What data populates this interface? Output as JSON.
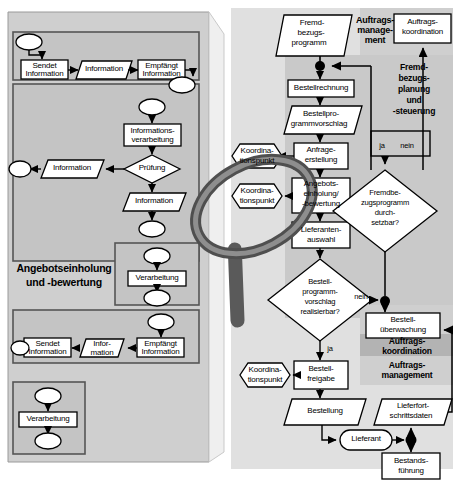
{
  "diagram": {
    "title_left": "Angebotseinholung und -bewertung",
    "left_panel": {
      "group_label_line1": "Angebotseinholung",
      "group_label_line2": "und -bewertung",
      "top_row": {
        "sendet": "Sendet Information",
        "flow": "Information",
        "empfaengt": "Empfängt Information"
      },
      "middle": {
        "verarbeitung": "Informations- verarbeitung",
        "verarbeitung_l1": "Informations-",
        "verarbeitung_l2": "verarbeitung",
        "pruefung": "Prüfung",
        "info_left": "Information",
        "info_down": "Information"
      },
      "verarbeitung_box": "Verarbeitung",
      "bottom_row": {
        "empfaengt": "Empfängt Information",
        "flow_l1": "Infor-",
        "flow_l2": "mation",
        "sendet": "Sendet Information"
      },
      "bottom_box": "Verarbeitung"
    },
    "right_panel": {
      "fremdbezugsprogramm_l1": "Fremd-",
      "fremdbezugsprogramm_l2": "bezugs-",
      "fremdbezugsprogramm_l3": "programm",
      "auftragsmanagement_l1": "Auftrags-",
      "auftragsmanagement_l2": "manage-",
      "auftragsmanagement_l3": "ment",
      "auftragskoordination_l1": "Auftrags-",
      "auftragskoordination_l2": "koordination",
      "bestellrechnung": "Bestellrechnung",
      "bestellprogrammvorschlag_l1": "Bestellpro-",
      "bestellprogrammvorschlag_l2": "grammvorschlag",
      "fremdbezugsplanung_l1": "Fremd-",
      "fremdbezugsplanung_l2": "bezugs-",
      "fremdbezugsplanung_l3": "planung",
      "fremdbezugsplanung_l4": "und",
      "fremdbezugsplanung_l5": "-steuerung",
      "anfrageerstellung_l1": "Anfrage-",
      "anfrageerstellung_l2": "erstellung",
      "koordinationspunkt_top_l1": "Koordina-",
      "koordinationspunkt_top_l2": "tionspunkt",
      "koordinationspunkt_mid_l1": "Koordina-",
      "koordinationspunkt_mid_l2": "tionspunkt",
      "angebotseinholung_l1": "Angebots-",
      "angebotseinholung_l2": "einholung/",
      "angebotseinholung_l3": "-bewertung",
      "lieferantenauswahl_l1": "Lieferanten-",
      "lieferantenauswahl_l2": "auswahl",
      "fremdbezug_decision_l1": "Fremdbe-",
      "fremdbezug_decision_l2": "zugsprogramm",
      "fremdbezug_decision_l3": "durch-",
      "fremdbezug_decision_l4": "setzbar?",
      "bestellprogramm_decision_l1": "Bestell-",
      "bestellprogramm_decision_l2": "programm-",
      "bestellprogramm_decision_l3": "vorschlag",
      "bestellprogramm_decision_l4": "realisierbar?",
      "ja_label": "ja",
      "nein_label": "nein",
      "ja_nein_ja": "ja",
      "ja_nein_nein": "nein",
      "nein_branch": "nein",
      "bestelluberwachung_l1": "Bestell-",
      "bestelluberwachung_l2": "überwachung",
      "auftragskoordination2_l1": "Auftrags-",
      "auftragskoordination2_l2": "koordination",
      "auftragsmanagement2_l1": "Auftrags-",
      "auftragsmanagement2_l2": "management",
      "koordinationspunkt_bottom_l1": "Koordina-",
      "koordinationspunkt_bottom_l2": "tionspunkt",
      "bestellfreigabe_l1": "Bestell-",
      "bestellfreigabe_l2": "freigabe",
      "bestellung": "Bestellung",
      "lieferfortschrittsdaten_l1": "Lieferfort-",
      "lieferfortschrittsdaten_l2": "schrittsdaten",
      "lieferant": "Lieferant",
      "bestandsfuehrung_l1": "Bestands-",
      "bestandsfuehrung_l2": "führung"
    },
    "icons": {
      "magnifier": "magnifier-icon"
    },
    "colors": {
      "panel_bg": "#c8c8c8",
      "panel_bg_light": "#e3e3e3",
      "panel_bg_inner": "#b4b4b4",
      "shape_fill": "#ffffff",
      "line": "#000000",
      "magnifier_dark": "#555555",
      "magnifier_mid": "#8a8a8a"
    }
  }
}
